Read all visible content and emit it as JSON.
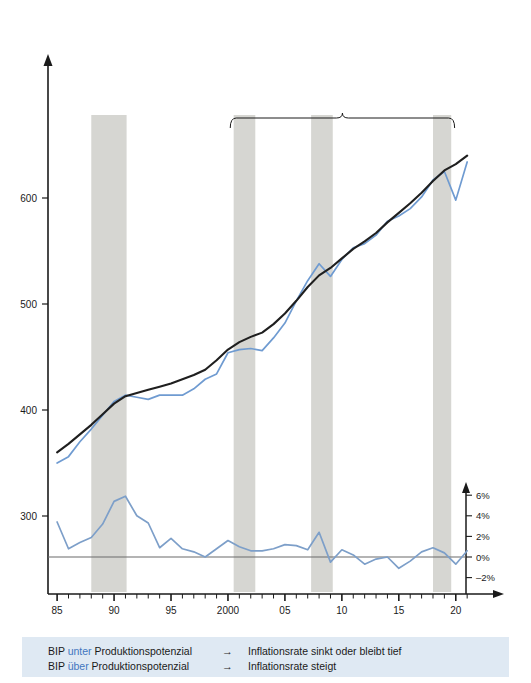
{
  "figure": {
    "y_axis_caption_lines": [
      "Mrd. CHF",
      "zu Preisen",
      "von 2000"
    ],
    "annotations": {
      "left_block": {
        "title_lines": [
          "Hoch-",
          "konjunktur"
        ],
        "subtitle_lines": [
          "BIP über",
          "Produktions-",
          "potenzial"
        ]
      },
      "right_block": {
        "title_lines": [
          "Schwache",
          "Hochkonjunktur"
        ],
        "subtitle_lines": [
          "BIP = ca.",
          "Produktions-",
          "potenzial"
        ]
      },
      "series_label_potential_lines": [
        "Produktions-",
        "potenzial"
      ],
      "series_label_gdp": "BIP",
      "series_label_inflation": "Inflationsrate"
    },
    "legend": {
      "rows": [
        {
          "prefix": "BIP ",
          "highlight": "unter",
          "suffix": " Produktionspotenzial",
          "arrow": "→",
          "consequence": "Inflationsrate sinkt oder bleibt tief"
        },
        {
          "prefix": "BIP ",
          "highlight": "über",
          "suffix": " Produktionspotenzial",
          "arrow": "→",
          "consequence": "Inflationsrate steigt"
        }
      ]
    },
    "colors": {
      "gdp_line": "#6f9bd1",
      "potential_line": "#1f1f1f",
      "inflation_line": "#7d9fc9",
      "band": "#d6d6d2",
      "legend_background": "#dfe9f3",
      "highlight_text": "#3f76bf"
    }
  },
  "chart_data": {
    "type": "line",
    "title": "",
    "xlabel": "",
    "ylabel": "Mrd. CHF zu Preisen von 2000",
    "ylabel_right": "%",
    "xlim": [
      1984.2,
      2021.6
    ],
    "ylim": [
      255,
      665
    ],
    "ylim_right": [
      -3.4,
      7.2
    ],
    "grid": false,
    "legend_position": "inline-labels",
    "y_ticks": [
      300,
      400,
      500,
      600
    ],
    "y_ticks_right": [
      -2,
      0,
      2,
      4,
      6
    ],
    "y_tick_labels_right": [
      "–2%",
      "0%",
      "2%",
      "4%",
      "6%"
    ],
    "x_ticks_major": [
      1985,
      1990,
      1995,
      2000,
      2005,
      2010,
      2015,
      2020
    ],
    "x_tick_labels_major": [
      "85",
      "90",
      "95",
      "2000",
      "05",
      "10",
      "15",
      "20"
    ],
    "x_ticks_minor_step": 1,
    "shaded_bands": [
      {
        "start": 1988.0,
        "end": 1991.1,
        "label": "Hochkonjunktur"
      },
      {
        "start": 2000.5,
        "end": 2002.4,
        "label": "Schwache Hochkonjunktur"
      },
      {
        "start": 2007.3,
        "end": 2009.2,
        "label": "Schwache Hochkonjunktur"
      },
      {
        "start": 2018.0,
        "end": 2019.6,
        "label": "Schwache Hochkonjunktur"
      }
    ],
    "bracket_right": {
      "start": 2000.2,
      "end": 2019.9,
      "label": "Schwache Hochkonjunktur"
    },
    "x": [
      1985,
      1986,
      1987,
      1988,
      1989,
      1990,
      1991,
      1992,
      1993,
      1994,
      1995,
      1996,
      1997,
      1998,
      1999,
      2000,
      2001,
      2002,
      2003,
      2004,
      2005,
      2006,
      2007,
      2008,
      2009,
      2010,
      2011,
      2012,
      2013,
      2014,
      2015,
      2016,
      2017,
      2018,
      2019,
      2020,
      2021
    ],
    "series": [
      {
        "name": "BIP",
        "axis": "left",
        "color": "#6f9bd1",
        "values": [
          350,
          356,
          370,
          382,
          395,
          408,
          414,
          412,
          410,
          414,
          414,
          414,
          420,
          429,
          434,
          454,
          457,
          458,
          456,
          468,
          482,
          503,
          522,
          538,
          526,
          542,
          553,
          557,
          565,
          578,
          583,
          590,
          601,
          617,
          625,
          598,
          634
        ]
      },
      {
        "name": "Produktionspotenzial",
        "axis": "left",
        "color": "#1f1f1f",
        "values": [
          360,
          368,
          377,
          386,
          396,
          406,
          413,
          416,
          419,
          422,
          425,
          429,
          433,
          438,
          447,
          457,
          464,
          469,
          473,
          481,
          491,
          503,
          516,
          527,
          534,
          543,
          552,
          559,
          567,
          577,
          586,
          595,
          605,
          616,
          626,
          632,
          640
        ]
      },
      {
        "name": "Inflationsrate",
        "axis": "right",
        "color": "#7d9fc9",
        "values": [
          3.4,
          0.8,
          1.4,
          1.9,
          3.2,
          5.4,
          5.9,
          4.0,
          3.3,
          0.9,
          1.8,
          0.8,
          0.5,
          0.0,
          0.8,
          1.6,
          1.0,
          0.6,
          0.6,
          0.8,
          1.2,
          1.1,
          0.7,
          2.4,
          -0.5,
          0.7,
          0.2,
          -0.7,
          -0.2,
          0.0,
          -1.1,
          -0.4,
          0.5,
          0.9,
          0.4,
          -0.7,
          0.6
        ]
      }
    ]
  }
}
